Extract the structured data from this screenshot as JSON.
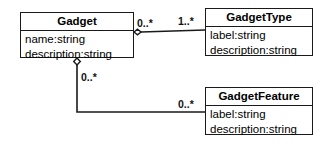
{
  "diagram": {
    "type": "uml-class-diagram",
    "background_color": "#ffffff",
    "line_color": "#1a1a1a",
    "text_color": "#000000",
    "classes": [
      {
        "id": "gadget",
        "name": "Gadget",
        "attributes": [
          "name:string",
          "description:string"
        ]
      },
      {
        "id": "gadgettype",
        "name": "GadgetType",
        "attributes": [
          "label:string",
          "description:string"
        ]
      },
      {
        "id": "gadgetfeature",
        "name": "GadgetFeature",
        "attributes": [
          "label:string",
          "description:string"
        ]
      }
    ],
    "associations": [
      {
        "id": "gadget-gadgettype",
        "from": "gadget",
        "to": "gadgettype",
        "kind": "aggregation",
        "diamond_end": "gadget",
        "source_multiplicity": "0..*",
        "target_multiplicity": "1..*"
      },
      {
        "id": "gadget-gadgetfeature",
        "from": "gadget",
        "to": "gadgetfeature",
        "kind": "aggregation",
        "diamond_end": "gadget",
        "source_multiplicity": "0..*",
        "target_multiplicity": "0..*"
      }
    ]
  }
}
